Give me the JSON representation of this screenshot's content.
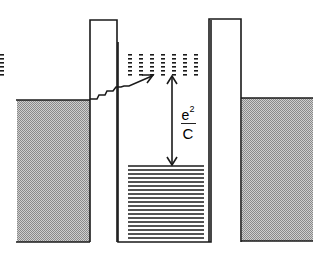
{
  "diagram": {
    "type": "coulomb-blockade-energy-diagram",
    "colors": {
      "line": "#1a1a1a",
      "shade": "#b8b8b8",
      "background": "#ffffff"
    },
    "energy_gap_label": {
      "numerator_base": "e",
      "numerator_exponent": "2",
      "denominator": "C"
    },
    "elements": {
      "left_lead": "shaded electrode (filled Fermi sea)",
      "left_barrier": "tunnel barrier",
      "island": "quantum dot / island with filled levels and empty levels",
      "right_barrier": "tunnel barrier",
      "right_lead": "shaded electrode (filled Fermi sea)",
      "tunneling_arrow": "zigzag tunneling path from left lead into empty levels",
      "gap_arrow": "double-headed arrow marking charging energy"
    },
    "empty_level_columns": 7,
    "empty_level_rows": 6,
    "filled_level_count": 19
  }
}
